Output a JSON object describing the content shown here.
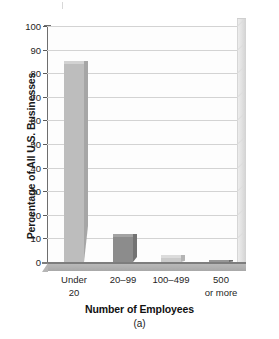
{
  "chart_data": {
    "type": "bar",
    "title": "",
    "subtitle": "",
    "caption": "(a)",
    "xlabel": "Number of Employees",
    "ylabel": "Percentage of All U.S. Businesses",
    "categories": [
      "Under 20",
      "20–99",
      "100–499",
      "500 or more"
    ],
    "category_lines": [
      {
        "line1": "Under",
        "line2": "20"
      },
      {
        "line1": "20–99",
        "line2": ""
      },
      {
        "line1": "100–499",
        "line2": ""
      },
      {
        "line1": "500",
        "line2": "or more"
      }
    ],
    "values": [
      85,
      12,
      3,
      1
    ],
    "ylim": [
      0,
      100
    ],
    "ytick_step": 10,
    "yticks": [
      100,
      90,
      80,
      70,
      60,
      50,
      40,
      30,
      20,
      10,
      0
    ],
    "grid": true,
    "legend": "none",
    "style": "3d-bar",
    "bar_colors": [
      "#bdbdbd",
      "#8c8c8c",
      "#cbcbcb",
      "#7e7e7e"
    ],
    "bar_side_colors": [
      "#a6a6a6",
      "#737373",
      "#b4b4b4",
      "#6a6a6a"
    ],
    "bar_top_colors": [
      "#d2d2d2",
      "#a3a3a3",
      "#dcdcdc",
      "#969696"
    ]
  },
  "colors": {
    "axis": "#6e6e6e",
    "gridline": "#d3d3d3",
    "floor": "#b2b2b2",
    "side_wall": "#e2e2e2",
    "text": "#1a1a1a",
    "plot_background": "#fdfdfd"
  }
}
